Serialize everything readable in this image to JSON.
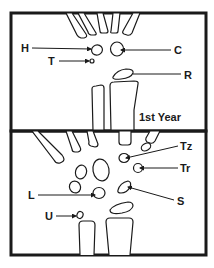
{
  "figure": {
    "panels": [
      {
        "id": "top",
        "caption": "1st Year",
        "labels": {
          "H": "H",
          "T": "T",
          "C": "C",
          "R": "R"
        }
      },
      {
        "id": "bottom",
        "caption": "",
        "labels": {
          "Tz": "Tz",
          "Tr": "Tr",
          "L": "L",
          "S": "S",
          "U": "U"
        }
      }
    ],
    "colors": {
      "ink": "#1a1a1a",
      "background": "#ffffff"
    }
  }
}
